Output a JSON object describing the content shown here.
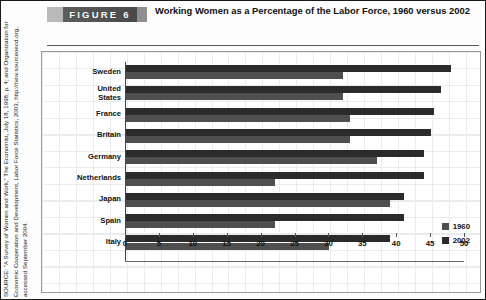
{
  "figure": {
    "badge_label": "FIGURE  6",
    "title": "Working Women as a Percentage of the Labor Force, 1960 versus 2002"
  },
  "source": {
    "text": "SOURCE: \"A Survey of Women and Work,\" The Economist, July 18, 1998, p. 4; and Organization for Economic Cooperation and Development, Labor Force Statistics, 2003, http://new.sourceoecd.org, accessed September 2004."
  },
  "legend": {
    "items": [
      {
        "label": "1960",
        "color": "#4f4f4f"
      },
      {
        "label": "2002",
        "color": "#2b2b2b"
      }
    ]
  },
  "chart_data": {
    "type": "bar",
    "orientation": "horizontal",
    "title": "Working Women as a Percentage of the Labor Force, 1960 versus 2002",
    "xlabel": "",
    "ylabel": "",
    "xlim": [
      0,
      50
    ],
    "xticks": [
      0,
      5,
      10,
      15,
      20,
      25,
      30,
      35,
      40,
      45,
      50
    ],
    "grid": true,
    "legend_position": "right",
    "categories": [
      "Sweden",
      "United\nStates",
      "France",
      "Britain",
      "Germany",
      "Netherlands",
      "Japan",
      "Spain",
      "Italy"
    ],
    "series": [
      {
        "name": "1960",
        "color": "#4f4f4f",
        "values": [
          32,
          32,
          33,
          33,
          37,
          22,
          39,
          22,
          30
        ]
      },
      {
        "name": "2002",
        "color": "#2b2b2b",
        "values": [
          48,
          46.5,
          45.5,
          45,
          44,
          44,
          41,
          41,
          39
        ]
      }
    ]
  }
}
